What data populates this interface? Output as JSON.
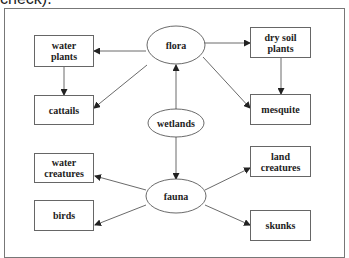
{
  "caption": "check).",
  "diagram": {
    "center": "wetlands",
    "nodes": {
      "flora": "flora",
      "wetlands": "wetlands",
      "fauna": "fauna",
      "water_plants": "water plants",
      "cattails": "cattails",
      "dry_soil_plants": "dry soil plants",
      "mesquite": "mesquite",
      "water_creatures": "water creatures",
      "land_creatures": "land creatures",
      "birds": "birds",
      "skunks": "skunks"
    },
    "edges": [
      {
        "from": "wetlands",
        "to": "flora"
      },
      {
        "from": "wetlands",
        "to": "fauna"
      },
      {
        "from": "flora",
        "to": "water plants"
      },
      {
        "from": "flora",
        "to": "cattails"
      },
      {
        "from": "flora",
        "to": "dry soil plants"
      },
      {
        "from": "flora",
        "to": "mesquite"
      },
      {
        "from": "water plants",
        "to": "cattails"
      },
      {
        "from": "dry soil plants",
        "to": "mesquite"
      },
      {
        "from": "fauna",
        "to": "water creatures"
      },
      {
        "from": "fauna",
        "to": "birds"
      },
      {
        "from": "fauna",
        "to": "land creatures"
      },
      {
        "from": "fauna",
        "to": "skunks"
      }
    ]
  }
}
